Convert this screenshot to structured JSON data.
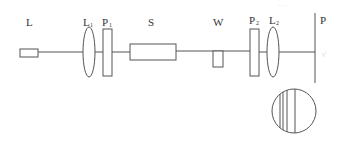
{
  "diagram": {
    "type": "optical-setup",
    "components": [
      {
        "id": "L",
        "label": "L",
        "sub": "",
        "kind": "laser-source"
      },
      {
        "id": "L1",
        "label": "L",
        "sub": "1",
        "kind": "lens"
      },
      {
        "id": "P1",
        "label": "P",
        "sub": "1",
        "kind": "polarizer"
      },
      {
        "id": "S",
        "label": "S",
        "sub": "",
        "kind": "sample"
      },
      {
        "id": "W",
        "label": "W",
        "sub": "",
        "kind": "wedge"
      },
      {
        "id": "P2",
        "label": "P",
        "sub": "2",
        "kind": "polarizer"
      },
      {
        "id": "L2",
        "label": "L",
        "sub": "2",
        "kind": "lens"
      },
      {
        "id": "P",
        "label": "P",
        "sub": "",
        "kind": "screen"
      }
    ],
    "fringe_pattern": {
      "kind": "interference-fringes",
      "line_count": 4
    },
    "colors": {
      "line": "#555555",
      "text": "#333333",
      "background": "#ffffff"
    }
  }
}
